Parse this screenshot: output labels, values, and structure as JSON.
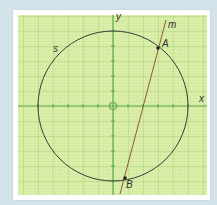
{
  "diagram": {
    "axes": {
      "x_label": "x",
      "y_label": "y",
      "origin_marker": "open-circle"
    },
    "circle": {
      "label": "s",
      "center": [
        0,
        0
      ],
      "radius_units": 5
    },
    "line": {
      "label": "m"
    },
    "points": [
      {
        "label": "A",
        "approx": [
          3,
          4
        ]
      },
      {
        "label": "B",
        "approx": [
          1,
          -5
        ]
      }
    ],
    "grid": {
      "unit_px": 15,
      "minor_divisions": 5
    },
    "colors": {
      "background": "#d3e3ea",
      "grid_fill": "#dbefa8",
      "grid_minor": "#b9d98a",
      "grid_major": "#93c46a",
      "axis": "#5aa84a",
      "circle": "#3a3a3a",
      "line": "#8a5a3a"
    }
  }
}
